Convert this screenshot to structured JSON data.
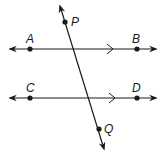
{
  "diagram": {
    "type": "parallel lines cut by a transversal",
    "stroke_color": "#1a1a1a",
    "lines": [
      {
        "name": "line-AB",
        "from": [
          10,
          49
        ],
        "to": [
          156,
          49
        ],
        "arrows": "both",
        "parallel_mark": [
          110,
          49
        ]
      },
      {
        "name": "line-CD",
        "from": [
          10,
          98
        ],
        "to": [
          156,
          98
        ],
        "arrows": "both",
        "parallel_mark": [
          112,
          98
        ]
      },
      {
        "name": "transversal-PQ",
        "from": [
          60,
          6
        ],
        "to": [
          104,
          149
        ],
        "arrows": "both"
      }
    ],
    "points": [
      {
        "label": "P",
        "x": 65,
        "y": 22,
        "label_x": 72,
        "label_y": 26
      },
      {
        "label": "A",
        "x": 30,
        "y": 49,
        "label_x": 26,
        "label_y": 42
      },
      {
        "label": "B",
        "x": 137,
        "y": 49,
        "label_x": 132,
        "label_y": 42
      },
      {
        "label": "C",
        "x": 30,
        "y": 98,
        "label_x": 26,
        "label_y": 91
      },
      {
        "label": "D",
        "x": 137,
        "y": 98,
        "label_x": 132,
        "label_y": 91
      },
      {
        "label": "Q",
        "x": 99,
        "y": 129,
        "label_x": 105,
        "label_y": 133
      }
    ]
  }
}
